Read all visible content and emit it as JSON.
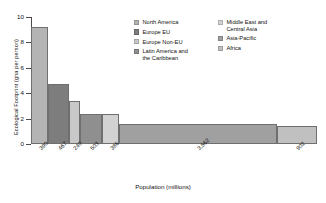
{
  "chart_data": {
    "type": "bar",
    "variant": "marimekko-variable-width",
    "title": "",
    "xlabel": "Population (millions)",
    "ylabel": "Ecological Footprint (gha per person)",
    "ylim": [
      0,
      10
    ],
    "yticks": [
      0,
      2,
      4,
      6,
      8,
      10
    ],
    "ytick_labels": [
      "0",
      "2",
      "4",
      "6",
      "8",
      "10"
    ],
    "grid": false,
    "legend_position": "inside-top-right",
    "xtick_labels": [
      "390",
      "467",
      "240",
      "503",
      "386",
      "3,562",
      "902"
    ],
    "categories": [
      "North America",
      "Europe EU",
      "Europe Non-EU",
      "Latin America and the Caribbean",
      "Middle East and Central Asia",
      "Asia-Pacific",
      "Africa"
    ],
    "widths_population_millions": [
      390,
      467,
      240,
      503,
      386,
      3562,
      902
    ],
    "values_gha_per_person": [
      9.2,
      4.7,
      3.4,
      2.4,
      2.4,
      1.6,
      1.4
    ],
    "colors": [
      "#b4b4b4",
      "#7d7d7d",
      "#c8c8c8",
      "#8f8f8f",
      "#d2d2d2",
      "#a0a0a0",
      "#c0c0c0"
    ],
    "series": [
      {
        "name": "Ecological Footprint (gha per person)",
        "values": [
          9.2,
          4.7,
          3.4,
          2.4,
          2.4,
          1.6,
          1.4
        ]
      }
    ],
    "bars": [
      {
        "label": "North America",
        "population": 390,
        "footprint": 9.2,
        "color": "#b4b4b4",
        "tick": "390"
      },
      {
        "label": "Europe EU",
        "population": 467,
        "footprint": 4.7,
        "color": "#7d7d7d",
        "tick": "467"
      },
      {
        "label": "Europe Non-EU",
        "population": 240,
        "footprint": 3.4,
        "color": "#c8c8c8",
        "tick": "240"
      },
      {
        "label": "Latin America and the Caribbean",
        "population": 503,
        "footprint": 2.4,
        "color": "#8f8f8f",
        "tick": "503"
      },
      {
        "label": "Middle East and Central Asia",
        "population": 386,
        "footprint": 2.4,
        "color": "#d2d2d2",
        "tick": "386"
      },
      {
        "label": "Asia-Pacific",
        "population": 3562,
        "footprint": 1.6,
        "color": "#a0a0a0",
        "tick": "3,562"
      },
      {
        "label": "Africa",
        "population": 902,
        "footprint": 1.4,
        "color": "#c0c0c0",
        "tick": "902"
      }
    ]
  },
  "legend": {
    "column_left": [
      {
        "label": "North America",
        "color": "#b4b4b4"
      },
      {
        "label": "Europe EU",
        "color": "#7d7d7d"
      },
      {
        "label": "Europe Non-EU",
        "color": "#c8c8c8"
      },
      {
        "label": "Latin America and\nthe Caribbean",
        "color": "#8f8f8f"
      }
    ],
    "column_right": [
      {
        "label": "Middle East and\nCentral Asia",
        "color": "#d2d2d2"
      },
      {
        "label": "Asia-Pacific",
        "color": "#a0a0a0"
      },
      {
        "label": "Africa",
        "color": "#c0c0c0"
      }
    ]
  }
}
